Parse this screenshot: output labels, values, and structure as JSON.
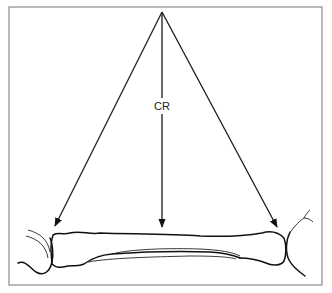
{
  "figure": {
    "type": "line-drawing",
    "labels": {
      "central_ray": "CR"
    },
    "rays": [
      {
        "name": "left-divergent-ray",
        "from": [
          162,
          12
        ],
        "to": [
          55,
          226
        ]
      },
      {
        "name": "central-ray",
        "from": [
          162,
          12
        ],
        "to": [
          162,
          227
        ]
      },
      {
        "name": "right-divergent-ray",
        "from": [
          162,
          12
        ],
        "to": [
          277,
          227
        ]
      }
    ],
    "colors": {
      "line": "#111111",
      "frame": "#8a8a8a",
      "background": "#ffffff"
    }
  }
}
